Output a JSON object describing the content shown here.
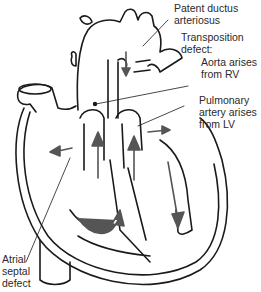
{
  "diagram": {
    "labels": [
      {
        "id": "pda",
        "text": "Patent ductus\narteriosus"
      },
      {
        "id": "transposition",
        "text": "Transposition\ndefect:"
      },
      {
        "id": "aorta",
        "text": "Aorta arises\nfrom RV"
      },
      {
        "id": "pulmonary",
        "text": "Pulmonary\nartery arises\nfrom LV"
      },
      {
        "id": "asd",
        "text": "Atrial\nseptal\ndefect"
      }
    ],
    "colors": {
      "line": "#1a1a1a",
      "arrow": "#555555",
      "text": "#2a2a2a",
      "background": "#ffffff"
    }
  }
}
